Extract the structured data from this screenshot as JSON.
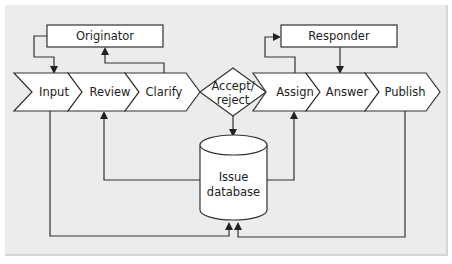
{
  "diagram": {
    "actors": {
      "originator": "Originator",
      "responder": "Responder"
    },
    "left_process": [
      {
        "label": "Input"
      },
      {
        "label": "Review"
      },
      {
        "label": "Clarify"
      }
    ],
    "decision": {
      "line1": "Accept/",
      "line2": "reject"
    },
    "right_process": [
      {
        "label": "Assign"
      },
      {
        "label": "Answer"
      },
      {
        "label": "Publish"
      }
    ],
    "database": {
      "line1": "Issue",
      "line2": "database"
    },
    "colors": {
      "background": "#ececec",
      "shape_fill": "#ffffff",
      "stroke": "#333333",
      "text": "#222222"
    }
  }
}
